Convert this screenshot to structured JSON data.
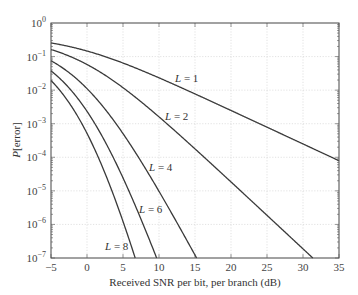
{
  "chart_data": {
    "type": "line",
    "title": "",
    "xlabel": "Received SNR per bit, per branch (dB)",
    "ylabel": "P[error]",
    "xlim": [
      -5,
      35
    ],
    "ylim": [
      1e-07,
      1
    ],
    "yscale": "log",
    "grid": true,
    "legend": "none (inline curve labels)",
    "x_ticks": [
      "-5",
      "0",
      "5",
      "10",
      "15",
      "20",
      "25",
      "30",
      "35"
    ],
    "y_ticks": [
      "10^0",
      "10^-1",
      "10^-2",
      "10^-3",
      "10^-4",
      "10^-5",
      "10^-6",
      "10^-7"
    ],
    "x": [
      -5,
      0,
      5,
      10,
      15,
      20,
      25,
      30,
      35
    ],
    "series": [
      {
        "name": "L = 1",
        "label": "L = 1",
        "L": 1,
        "values": [
          0.2549,
          0.1464,
          0.0642,
          0.02327,
          0.00773,
          0.00248,
          0.00079,
          0.00025,
          7.9e-05
        ]
      },
      {
        "name": "L = 2",
        "label": "L = 2",
        "L": 2,
        "values": [
          0.1618,
          0.058,
          0.01184,
          0.0016,
          0.000178,
          1.84e-05,
          1.87e-06,
          1.88e-07,
          null
        ]
      },
      {
        "name": "L = 4",
        "label": "L = 4",
        "L": 4,
        "values": [
          0.0752,
          0.01109,
          0.000508,
          9.7e-06,
          1.23e-07,
          null,
          null,
          null,
          null
        ]
      },
      {
        "name": "L = 6",
        "label": "L = 6",
        "L": 6,
        "values": [
          0.0376,
          0.00234,
          2.44e-05,
          6.8e-08,
          null,
          null,
          null,
          null,
          null
        ]
      },
      {
        "name": "L = 8",
        "label": "L = 8",
        "L": 8,
        "values": [
          0.01946,
          0.000515,
          1.23e-06,
          null,
          null,
          null,
          null,
          null,
          null
        ]
      }
    ],
    "annotations": [
      {
        "text": "L = 1",
        "x_db": 13.5,
        "y": 0.015
      },
      {
        "text": "L = 2",
        "x_db": 12.2,
        "y": 0.0011
      },
      {
        "text": "L = 4",
        "x_db": 8.5,
        "y": 8.5e-05
      },
      {
        "text": "L = 6",
        "x_db": 7.3,
        "y": 4.8e-06
      },
      {
        "text": "L = 8",
        "x_db": 2.6,
        "y": 3.5e-07
      }
    ]
  },
  "axes": {
    "xlabel": "Received SNR per bit, per branch (dB)",
    "ylabel_italic": "P",
    "ylabel_rest": "[error]",
    "x_ticks": [
      "−5",
      "0",
      "5",
      "10",
      "15",
      "20",
      "25",
      "30",
      "35"
    ],
    "y_tick_base": "10",
    "y_tick_exps": [
      "0",
      "−1",
      "−2",
      "−3",
      "−4",
      "−5",
      "−6",
      "−7"
    ]
  },
  "curve_labels": [
    {
      "italic": "L",
      "rest": " = 1"
    },
    {
      "italic": "L",
      "rest": " = 2"
    },
    {
      "italic": "L",
      "rest": " = 4"
    },
    {
      "italic": "L",
      "rest": " = 6"
    },
    {
      "italic": "L",
      "rest": " = 8"
    }
  ]
}
